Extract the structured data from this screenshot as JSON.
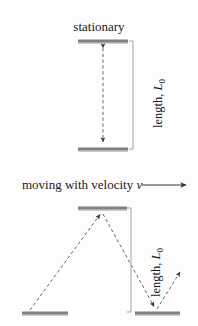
{
  "figure": {
    "title_stationary": "stationary",
    "moving_text": "moving with velocity",
    "moving_symbol": "v",
    "length_label_text": "length,",
    "length_symbol": "L",
    "length_subscript": "0",
    "colors": {
      "background": "#fdfdfd",
      "mirror_bar": "#808080",
      "mirror_bar_shadow": "#b8b8b8",
      "dashed_path": "#555555",
      "bracket": "#888888",
      "text": "#1a1a1a",
      "arrow": "#333333"
    }
  },
  "diagram_data": {
    "type": "physics-diagram",
    "subject": "light clock time dilation",
    "panels": [
      {
        "name": "stationary-clock",
        "label": "stationary",
        "mirrors": [
          {
            "name": "top-mirror",
            "x1": 78,
            "x2": 128,
            "y": 41
          },
          {
            "name": "bottom-mirror",
            "x1": 78,
            "x2": 128,
            "y": 149
          }
        ],
        "light_path": {
          "name": "vertical-double-arrow",
          "style": "dashed",
          "points": [
            [
              103,
              46
            ],
            [
              103,
              144
            ]
          ],
          "arrowheads": [
            "start",
            "end"
          ]
        },
        "bracket": {
          "x": 133,
          "y1": 41,
          "y2": 149,
          "label": "length, L0"
        }
      },
      {
        "name": "moving-clock",
        "label": "moving with velocity v",
        "velocity_arrow": {
          "x1": 142,
          "x2": 188,
          "y": 185,
          "direction": "right"
        },
        "mirrors": [
          {
            "name": "top-mirror",
            "x1": 78,
            "x2": 127,
            "y": 208
          },
          {
            "name": "bottom-mirror-left",
            "x1": 22,
            "x2": 68,
            "y": 313
          },
          {
            "name": "bottom-mirror-right",
            "x1": 135,
            "x2": 180,
            "y": 313
          }
        ],
        "light_path": {
          "name": "zigzag-light-path",
          "style": "dashed",
          "points": [
            [
              30,
              310
            ],
            [
              101,
              213
            ],
            [
              155,
              308
            ],
            [
              181,
              270
            ]
          ],
          "arrowheads": [
            "at-apex",
            "at-bottom-bounce",
            "at-end"
          ]
        },
        "bracket": {
          "x": 131,
          "y1": 208,
          "y2": 312,
          "label": "length, L0"
        }
      }
    ]
  }
}
